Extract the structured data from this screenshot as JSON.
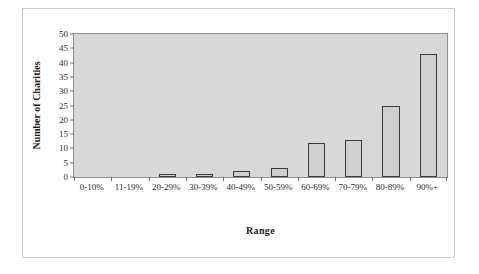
{
  "chart_data": {
    "type": "bar",
    "title": "",
    "xlabel": "Range",
    "ylabel": "Number of Charities",
    "categories": [
      "0-10%",
      "11-19%",
      "20-29%",
      "30-39%",
      "40-49%",
      "50-59%",
      "60-69%",
      "70-79%",
      "80-89%",
      "90%+"
    ],
    "values": [
      0,
      0,
      1,
      1,
      2,
      3,
      12,
      13,
      25,
      43
    ],
    "ylim": [
      0,
      50
    ],
    "ytick_step": 5,
    "yticks": [
      0,
      5,
      10,
      15,
      20,
      25,
      30,
      35,
      40,
      45,
      50
    ],
    "ytick_labels": [
      "0",
      "5",
      "10",
      "15",
      "20",
      "25",
      "30",
      "35",
      "40",
      "45",
      "50"
    ],
    "grid": false,
    "legend": false,
    "legend_position": "none",
    "colors": {
      "bar_fill": "#cfcfcf",
      "bar_border": "#3a3a3a",
      "plot_background": "#d8d8d8",
      "axis": "#8f8f8f",
      "text": "#2b2b2b",
      "frame_border": "#c8c8c8"
    }
  }
}
